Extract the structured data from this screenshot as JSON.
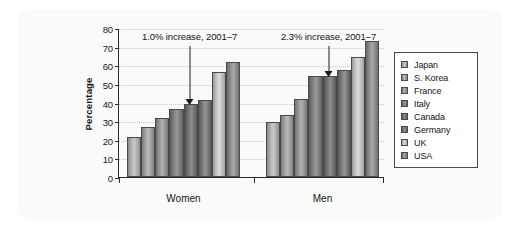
{
  "chart_data": {
    "type": "bar",
    "title": "",
    "subtitle": "",
    "xlabel": "",
    "ylabel": "Percentage",
    "ylim": [
      0,
      80
    ],
    "yticks": [
      0,
      10,
      20,
      30,
      40,
      50,
      60,
      70,
      80
    ],
    "ytick_labels": [
      "0",
      "10",
      "20",
      "30",
      "40",
      "50",
      "60",
      "70",
      "80"
    ],
    "grid": true,
    "legend_position": "right",
    "categories": [
      "Women",
      "Men"
    ],
    "series": [
      {
        "name": "Japan",
        "values": [
          21.5,
          29.5
        ],
        "color": "#b9b9b9"
      },
      {
        "name": "S. Korea",
        "values": [
          27.0,
          33.5
        ],
        "color": "#a6a6a6"
      },
      {
        "name": "France",
        "values": [
          31.5,
          42.0
        ],
        "color": "#9a9a9a"
      },
      {
        "name": "Italy",
        "values": [
          36.5,
          54.5
        ],
        "color": "#7d7d7d"
      },
      {
        "name": "Canada",
        "values": [
          39.0,
          54.0
        ],
        "color": "#6f6f6f"
      },
      {
        "name": "Germany",
        "values": [
          41.5,
          57.5
        ],
        "color": "#787878"
      },
      {
        "name": "UK",
        "values": [
          56.5,
          64.5
        ],
        "color": "#cfcfcf"
      },
      {
        "name": "USA",
        "values": [
          61.5,
          73.0
        ],
        "color": "#8f8f8f"
      }
    ],
    "annotations": [
      {
        "text": "1.0% increase, 2001–7",
        "group": "Women",
        "points_to_series": "Canada",
        "value": 39.0
      },
      {
        "text": "2.3% increase, 2001–7",
        "group": "Men",
        "points_to_series": "Canada",
        "value": 54.0
      }
    ]
  },
  "legend": {
    "items": [
      {
        "label": "Japan"
      },
      {
        "label": "S. Korea"
      },
      {
        "label": "France"
      },
      {
        "label": "Italy"
      },
      {
        "label": "Canada"
      },
      {
        "label": "Germany"
      },
      {
        "label": "UK"
      },
      {
        "label": "USA"
      }
    ]
  },
  "colors": {
    "axis": "#2b2b2b",
    "grid": "#c8c8c8",
    "text": "#141414",
    "backdrop": "#fafafa",
    "bar_border": "#4a4a4a"
  }
}
